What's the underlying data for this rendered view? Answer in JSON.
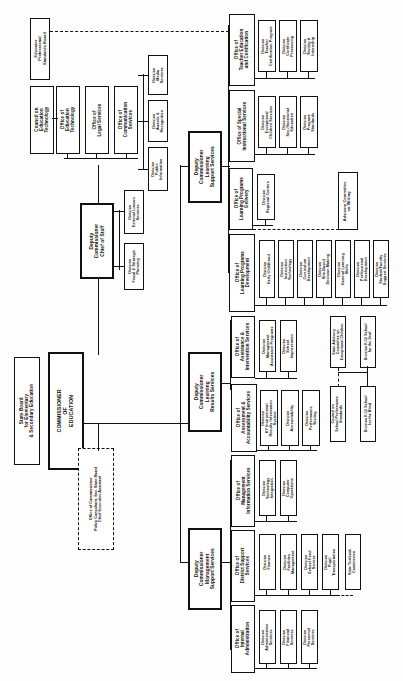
{
  "chart": {
    "type": "org-chart",
    "orientation": "rotated-90"
  },
  "nodes": {
    "state_board": "State Board\nfor Elementary\n& Secondary Education",
    "commissioner": "COMMISSIONER\nOF\nEDUCATION",
    "office_of_commissioner": "Office of Commissioner\nPolicy Consultant, Sec. State Board\nChief Executive Assistant",
    "dep_chief_of_staff": "Deputy\nCommissioner\nChief of Staff",
    "dep_learning_results": "Deputy\nCommissioner\nLearning\nResults Services",
    "dep_learning_support": "Deputy\nCommissioner\nLearning\nSupport Services",
    "dep_management_support": "Deputy\nCommissioner\nManagement\nSupport Services",
    "div_external_liaison": "Division\nExternal Liaison\nServices",
    "div_fiscal_strategic": "Division\nFiscal & Strategic\nPlanning",
    "educator_prof_standards_board": "Educator\nProfessional\nStandards Board",
    "council_education_technology": "Council on\nEducation\nTechnology",
    "office_education_technology": "Office of\nEducation\nTechnology",
    "office_legal_services": "Office of\nLegal Services",
    "office_communication_services": "Office of\nCommunication\nServices",
    "div_media_services": "Division\nMedia\nServices",
    "div_awards_recognition": "Division\nAwards &\nRecognition",
    "div_public_information": "Division\nPublic\nInformation",
    "office_teacher_education": "Office of\nTeacher Education\nand Certification",
    "div_teacher_cert_program": "Division\nTeacher\nCertification Program",
    "div_certificate_processing": "Division\nCertificate\nProcessing",
    "div_testing_internship": "Division\nTesting &\nInternship",
    "office_special_instructional": "Office of Special\nInstructional Services",
    "div_exceptional_children": "Division\nExceptional\nChildren Services",
    "div_sec_vocational": "Division\nSec./Vocational\nEducation",
    "div_program_standards": "Division\nProgram\nStandards",
    "office_learning_delivery": "Office of\nLearning Programs\nDelivery",
    "div_regional_centers": "Division\nRegional Centers",
    "advisory_committee_writing": "Advisory Committee\non Writing",
    "office_learning_development": "Office of\nLearning Programs\nDevelopment",
    "div_early_childhood": "Division\nEarly Childhood",
    "div_instruction_technology": "Division\nInstruction\nTechnology",
    "div_curriculum_development": "Division\nCurriculum\nDevelopment",
    "div_site_based": "Division\nSite-Based\nDecision Making",
    "div_general_learning": "Division\nGeneral Learning\nSkills",
    "div_professional_development": "Division\nProfessional\nDevelopment",
    "div_student_faculty_support": "Division\nStudent/Faculty\nSupport Services",
    "office_assistance_intervention": "Office of\nAssistance &\nIntervention Services",
    "div_management_assistance": "Division\nManagement\nAssistance Programs",
    "div_school_improvement": "Division\nSchool\nImprovement",
    "office_assessment_accountability": "Office of\nAssessment &\nAccountability Services",
    "div_ky_instructional_results": "Division\nKY Instructional\nResults Information\nSystem",
    "div_accountability": "Division\nAccountability",
    "div_performance_testing": "Division\nPerformance\nTesting",
    "state_advisory_council": "State Advisory\nCommittee on\nExceptional Children",
    "council_school_performance": "Council on\nSchool Performance\nStandards",
    "div_k12_school_deaf": "Division K-12 School\nfor the Deaf",
    "div_k12_school_blind": "Division K-12 School\nfor the Blind",
    "office_management_information": "Office of\nManagement\nInformation Services",
    "div_technology_integration": "Division\nTechnology\nIntegration",
    "div_computer_operations": "Division\nComputer\nOperations",
    "office_district_support": "Office of\nDistrict Support\nServices",
    "div_finance": "Division\nFinance",
    "div_facilities_management": "Division\nFacilities\nManagement",
    "div_school_food": "Division\nSchool Food\nService",
    "div_pupil_transportation": "Division\nPupil\nTransportation",
    "state_textbook_commission": "State Textbook\nCommission",
    "office_internal_administration": "Office of\nInternal\nAdministration",
    "div_administrative_services": "Division\nAdministrative\nServices",
    "div_financial_services": "Division\nFinancial\nServices",
    "div_personnel_services": "Division\nPersonnel\nServices"
  },
  "colors": {
    "line": "#111111",
    "box_fill": "#ffffff",
    "text": "#111111"
  }
}
